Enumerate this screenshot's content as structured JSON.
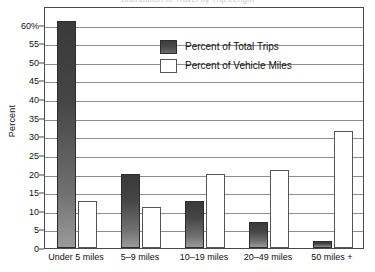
{
  "chart_data": {
    "type": "bar",
    "title": "Distribution of Travel by Trip Length",
    "xlabel": "",
    "ylabel": "Percent",
    "ylim": [
      0,
      65
    ],
    "grid": true,
    "legend_position": "upper-center",
    "categories": [
      "Under 5 miles",
      "5–9 miles",
      "10–19 miles",
      "20–49 miles",
      "50 miles +"
    ],
    "ticks": [
      "60%",
      "55",
      "50",
      "45",
      "40",
      "35",
      "30",
      "25",
      "20",
      "15",
      "10",
      "5",
      "0"
    ],
    "tick_values": [
      60,
      55,
      50,
      45,
      40,
      35,
      30,
      25,
      20,
      15,
      10,
      5,
      0
    ],
    "series": [
      {
        "name": "Percent of Total Trips",
        "color": "#3d3d3d",
        "values": [
          61,
          20,
          12.5,
          7,
          2
        ]
      },
      {
        "name": "Percent of Vehicle Miles",
        "color": "#ffffff",
        "values": [
          12.5,
          11,
          20,
          21,
          31.5
        ]
      }
    ]
  }
}
